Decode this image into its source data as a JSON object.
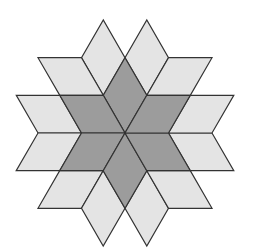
{
  "figure": {
    "center": [
      125,
      133
    ],
    "edge_length": 43.5,
    "colors": {
      "dark_fill": "#9c9c9c",
      "light_fill": "#e4e4e4",
      "stroke": "#333333",
      "background": "#ffffff"
    },
    "counts": {
      "dark_rhombi": 6,
      "light_rhombi": 12
    }
  }
}
